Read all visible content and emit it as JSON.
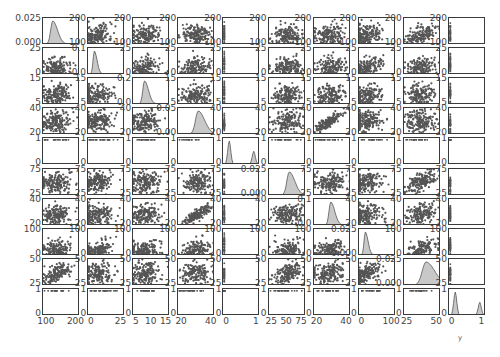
{
  "chart_data": {
    "type": "scatter",
    "title": "",
    "grid": {
      "rows": 10,
      "cols": 10,
      "diagonal": "kde"
    },
    "variables": [
      {
        "index": 0,
        "label": "",
        "xticks": [
          "100",
          "200"
        ],
        "yticks": [
          "100",
          "200"
        ],
        "range": [
          80,
          220
        ],
        "diag_yticks": [
          "0.000",
          "0.025"
        ]
      },
      {
        "index": 1,
        "label": "",
        "xticks": [
          "0",
          "25"
        ],
        "yticks": [
          "0",
          "25"
        ],
        "range": [
          0,
          30
        ],
        "diag_yticks": [
          "0.0",
          "0.1"
        ]
      },
      {
        "index": 2,
        "label": "",
        "xticks": [
          "5",
          "10",
          "15"
        ],
        "yticks": [
          "5",
          "10",
          "15"
        ],
        "range": [
          2,
          16
        ],
        "diag_yticks": [
          "0.0",
          "0.2"
        ]
      },
      {
        "index": 3,
        "label": "",
        "xticks": [
          "20",
          "40"
        ],
        "yticks": [
          "20",
          "40"
        ],
        "range": [
          10,
          45
        ],
        "diag_yticks": [
          "0.00",
          "0.05"
        ]
      },
      {
        "index": 4,
        "label": "",
        "xticks": [
          "0",
          "1"
        ],
        "yticks": [
          "0",
          "1"
        ],
        "range": [
          0,
          1
        ],
        "diag_yticks": [
          "0",
          "1"
        ],
        "binary": true
      },
      {
        "index": 5,
        "label": "",
        "xticks": [
          "25",
          "50",
          "75"
        ],
        "yticks": [
          "25",
          "50",
          "75"
        ],
        "range": [
          15,
          80
        ],
        "diag_yticks": [
          "0.000",
          "0.025"
        ]
      },
      {
        "index": 6,
        "label": "",
        "xticks": [
          "20",
          "40"
        ],
        "yticks": [
          "20",
          "40"
        ],
        "range": [
          12,
          48
        ],
        "diag_yticks": [
          "0.0",
          "0.1"
        ]
      },
      {
        "index": 7,
        "label": "",
        "xticks": [
          "0",
          "100"
        ],
        "yticks": [
          "0",
          "100"
        ],
        "range": [
          0,
          140
        ],
        "diag_yticks": [
          "0.000",
          "0.025"
        ]
      },
      {
        "index": 8,
        "label": "",
        "xticks": [
          "25",
          "50"
        ],
        "yticks": [
          "25",
          "50"
        ],
        "range": [
          15,
          65
        ],
        "diag_yticks": [
          "0.000",
          "0.025"
        ]
      },
      {
        "index": 9,
        "label": "y",
        "xticks": [
          "0",
          "1"
        ],
        "yticks": [
          "0",
          "1"
        ],
        "range": [
          0,
          1
        ],
        "diag_yticks": [
          "0",
          "1"
        ],
        "binary": true
      }
    ],
    "correlations_observed": {
      "3-6": "strong positive",
      "0-8": "positive",
      "1-7": "positive",
      "5-8": "positive",
      "7-8": "positive"
    },
    "xlabel_bottom": [
      "",
      "",
      "",
      "",
      "",
      "",
      "",
      "",
      "",
      "y"
    ],
    "colors": {
      "points": "#555555",
      "kde_fill": "#c8c8c8",
      "kde_line": "#555555",
      "frame": "#3a3a3a"
    }
  },
  "ui": {
    "bottom_axis_label": "y"
  }
}
